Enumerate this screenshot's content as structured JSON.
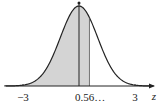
{
  "chart_data": {
    "type": "area",
    "title": "",
    "xlabel": "z",
    "ylabel": "",
    "xlim": [
      -3.4,
      3.6
    ],
    "x_ticks": [
      {
        "value": -3,
        "label": "−3"
      },
      {
        "value": 0.56,
        "label": "0.56…"
      },
      {
        "value": 3,
        "label": "3"
      }
    ],
    "shaded_region": {
      "from": "-inf",
      "to": 0.56
    },
    "mean_line": 0,
    "grid": false,
    "legend": null,
    "colors": {
      "curve": "#222222",
      "shade": "#d4d4d4"
    }
  },
  "labels": {
    "axis_var": "z",
    "tick_neg3": "−3",
    "tick_056": "0.56…",
    "tick_3": "3"
  }
}
